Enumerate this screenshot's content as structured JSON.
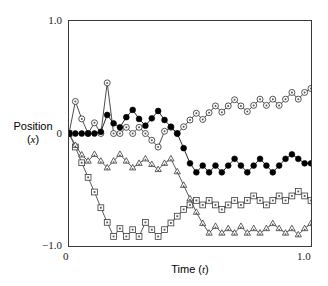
{
  "figure": {
    "background": "#ffffff",
    "frame_color": "#3a3a3a"
  },
  "axes": {
    "y_label_line1": "Position",
    "y_label_line2_prefix": "(",
    "y_label_line2_italic": "x",
    "y_label_line2_suffix": ")",
    "x_label_prefix": "Time (",
    "x_label_italic": "t",
    "x_label_suffix": ")",
    "y_ticks": [
      "1.0",
      "0",
      "−1.0"
    ],
    "x_ticks": [
      "0",
      "1.0"
    ]
  },
  "chart_data": {
    "type": "line",
    "title": "",
    "xlabel": "Time (t)",
    "ylabel": "Position (x)",
    "xlim": [
      0,
      1.0
    ],
    "ylim": [
      -1.0,
      1.0
    ],
    "grid": false,
    "legend": "none",
    "x": [
      0.0,
      0.0263,
      0.0526,
      0.0789,
      0.1053,
      0.1316,
      0.1579,
      0.1842,
      0.2105,
      0.2368,
      0.2632,
      0.2895,
      0.3158,
      0.3421,
      0.3684,
      0.3947,
      0.4211,
      0.4474,
      0.4737,
      0.5,
      0.5263,
      0.5526,
      0.5789,
      0.6053,
      0.6316,
      0.6579,
      0.6842,
      0.7105,
      0.7368,
      0.7632,
      0.7895,
      0.8158,
      0.8421,
      0.8684,
      0.8947,
      0.9211,
      0.9474,
      0.9737,
      1.0
    ],
    "series": [
      {
        "name": "walk-open-circle",
        "marker": "open-circle",
        "color": "#2b2b2b",
        "values": [
          0.0,
          0.285,
          0.13,
          0.0,
          0.095,
          0.0,
          0.45,
          0.0,
          0.0,
          0.055,
          0.0,
          0.055,
          0.0,
          -0.06,
          -0.12,
          0.02,
          0.055,
          0.0,
          0.06,
          0.12,
          0.18,
          0.125,
          0.185,
          0.245,
          0.19,
          0.245,
          0.3,
          0.245,
          0.195,
          0.25,
          0.305,
          0.25,
          0.305,
          0.25,
          0.305,
          0.365,
          0.305,
          0.365,
          0.4
        ]
      },
      {
        "name": "walk-filled-circle",
        "marker": "filled-circle",
        "color": "#000000",
        "values": [
          0.0,
          0.0,
          0.0,
          0.0,
          0.0,
          0.015,
          0.165,
          0.09,
          0.055,
          0.145,
          0.21,
          0.13,
          0.07,
          0.135,
          0.2,
          0.12,
          0.06,
          0.0,
          -0.13,
          -0.265,
          -0.345,
          -0.285,
          -0.345,
          -0.285,
          -0.345,
          -0.285,
          -0.225,
          -0.285,
          -0.345,
          -0.285,
          -0.225,
          -0.285,
          -0.345,
          -0.285,
          -0.225,
          -0.185,
          -0.225,
          -0.265,
          -0.265
        ]
      },
      {
        "name": "walk-square",
        "marker": "square",
        "color": "#3a3a3a",
        "values": [
          0.0,
          -0.12,
          -0.26,
          -0.39,
          -0.52,
          -0.66,
          -0.79,
          -0.915,
          -0.845,
          -0.915,
          -0.855,
          -0.915,
          -0.79,
          -0.855,
          -0.915,
          -0.855,
          -0.795,
          -0.735,
          -0.675,
          -0.635,
          -0.595,
          -0.635,
          -0.595,
          -0.635,
          -0.675,
          -0.635,
          -0.595,
          -0.635,
          -0.595,
          -0.555,
          -0.595,
          -0.635,
          -0.595,
          -0.555,
          -0.595,
          -0.555,
          -0.515,
          -0.555,
          -0.595
        ]
      },
      {
        "name": "walk-triangle",
        "marker": "triangle",
        "color": "#3a3a3a",
        "values": [
          0.0,
          -0.105,
          -0.19,
          -0.245,
          -0.185,
          -0.245,
          -0.305,
          -0.245,
          -0.185,
          -0.245,
          -0.305,
          -0.265,
          -0.225,
          -0.275,
          -0.32,
          -0.265,
          -0.225,
          -0.34,
          -0.46,
          -0.58,
          -0.7,
          -0.8,
          -0.885,
          -0.825,
          -0.885,
          -0.845,
          -0.885,
          -0.825,
          -0.885,
          -0.845,
          -0.885,
          -0.845,
          -0.8,
          -0.845,
          -0.885,
          -0.845,
          -0.9,
          -0.845,
          -0.8
        ]
      }
    ]
  }
}
